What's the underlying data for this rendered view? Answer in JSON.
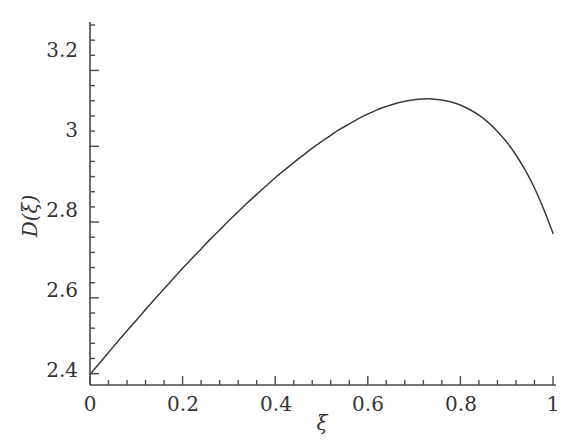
{
  "figure": {
    "background_color": "#ffffff",
    "line_color": "#3a3a3a",
    "axis_color": "#4a4a4a",
    "text_color": "#333333"
  },
  "chart_data": {
    "type": "line",
    "title": "",
    "subtitle": "",
    "xlabel": "ξ",
    "ylabel": "D(ξ)",
    "xlim": [
      0,
      1
    ],
    "ylim": [
      2.37,
      3.32
    ],
    "grid": false,
    "legend": null,
    "xticks": [
      0,
      0.2,
      0.4,
      0.6,
      0.8,
      1
    ],
    "xtick_labels": [
      "0",
      "0.2",
      "0.4",
      "0.6",
      "0.8",
      "1"
    ],
    "xminor_step": 0.04,
    "yticks": [
      2.4,
      2.6,
      2.8,
      3.0,
      3.2
    ],
    "ytick_labels": [
      "2.4",
      "2.6",
      "2.8",
      "3",
      "3.2"
    ],
    "yminor_step": 0.04,
    "series": [
      {
        "name": "D(ξ)",
        "x": [
          0.0,
          0.02,
          0.04,
          0.06,
          0.08,
          0.1,
          0.12,
          0.14,
          0.16,
          0.18,
          0.2,
          0.22,
          0.24,
          0.26,
          0.28,
          0.3,
          0.32,
          0.34,
          0.36,
          0.38,
          0.4,
          0.42,
          0.44,
          0.46,
          0.48,
          0.5,
          0.52,
          0.54,
          0.56,
          0.58,
          0.6,
          0.62,
          0.64,
          0.66,
          0.68,
          0.7,
          0.72,
          0.74,
          0.76,
          0.78,
          0.8,
          0.82,
          0.84,
          0.86,
          0.88,
          0.9,
          0.92,
          0.94,
          0.96,
          0.98,
          1.0
        ],
        "y": [
          2.398,
          2.427,
          2.456,
          2.485,
          2.513,
          2.541,
          2.569,
          2.597,
          2.624,
          2.651,
          2.678,
          2.704,
          2.729,
          2.755,
          2.779,
          2.804,
          2.827,
          2.851,
          2.873,
          2.895,
          2.917,
          2.937,
          2.957,
          2.976,
          2.995,
          3.012,
          3.029,
          3.045,
          3.059,
          3.073,
          3.085,
          3.096,
          3.105,
          3.113,
          3.119,
          3.123,
          3.125,
          3.125,
          3.122,
          3.117,
          3.109,
          3.097,
          3.082,
          3.063,
          3.039,
          3.011,
          2.977,
          2.937,
          2.89,
          2.834,
          2.77
        ]
      }
    ],
    "annotations": {
      "peak_x": 0.577,
      "peak_y": 3.285,
      "start_value": 2.398,
      "end_value": 2.455
    }
  },
  "axes_geometry": {
    "left_px": 90,
    "bottom_px": 385,
    "right_px": 553,
    "top_px": 25
  }
}
